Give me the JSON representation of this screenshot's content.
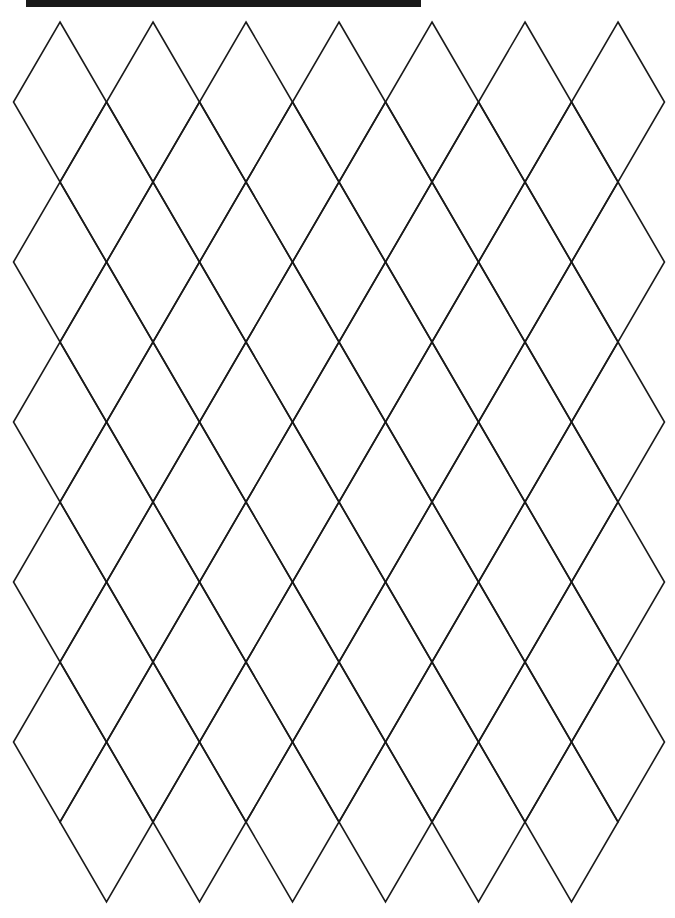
{
  "page": {
    "background": "#ffffff",
    "top_bar": {
      "color": "#1a1a1a",
      "x": 26,
      "y": 0,
      "width": 395,
      "height": 7
    }
  },
  "pattern": {
    "type": "rhombus-lattice",
    "stroke": "#1a1a1a",
    "stroke_width": 1.6,
    "diamond_half_width": 46.5,
    "diamond_half_height": 80,
    "lattice_a": {
      "x0": 60,
      "dx": 93,
      "cols": 7,
      "y0": 102,
      "dy": 160,
      "rows": 5
    },
    "lattice_b": {
      "x0": 106.5,
      "dx": 93,
      "cols": 6,
      "y0": 182,
      "dy": 160,
      "rows": 5
    }
  }
}
